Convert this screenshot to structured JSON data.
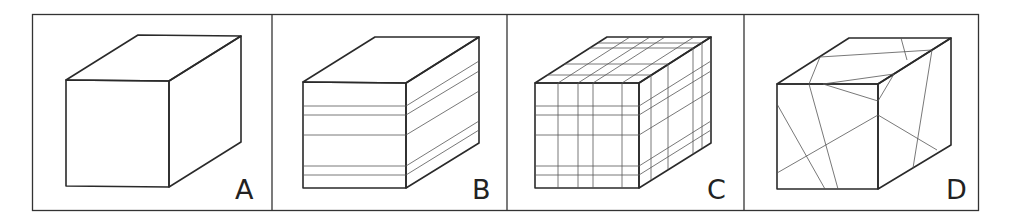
{
  "figure": {
    "type": "comparison-diagram",
    "panels": [
      {
        "label": "A",
        "pattern": "plain"
      },
      {
        "label": "B",
        "pattern": "horizontal-layers"
      },
      {
        "label": "C",
        "pattern": "grid"
      },
      {
        "label": "D",
        "pattern": "random-fractures"
      }
    ]
  },
  "colors": {
    "stroke": "#2a2a2a",
    "background": "#ffffff"
  }
}
